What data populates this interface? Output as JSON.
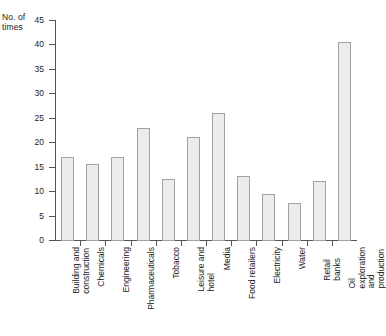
{
  "chart_data": {
    "type": "bar",
    "title": "",
    "subtitle": "",
    "ylabel": "No. of\ntimes",
    "xlabel": "",
    "ylim": [
      0,
      45
    ],
    "ytick_step": 5,
    "yticks": [
      0,
      5,
      10,
      15,
      20,
      25,
      30,
      35,
      40,
      45
    ],
    "ytick_labels": [
      "0",
      "5",
      "10",
      "15",
      "20",
      "25",
      "30",
      "35",
      "40",
      "45"
    ],
    "grid": false,
    "legend": null,
    "bar_fill_color": "#ececec",
    "bar_edge_color": "#a2a2a2",
    "axis_color": "#555555",
    "categories": [
      "Building and\nconstruction",
      "Chemicals",
      "Engineering",
      "Pharmaceuticals",
      "Tobacco",
      "Leisure and\nhotel",
      "Media",
      "Food retailers",
      "Electricity",
      "Water",
      "Retail banks",
      "Oil exploration\nand production"
    ],
    "values": [
      17,
      15.5,
      17,
      23,
      12.5,
      21,
      26,
      13,
      9.5,
      7.5,
      12,
      40.5
    ]
  }
}
